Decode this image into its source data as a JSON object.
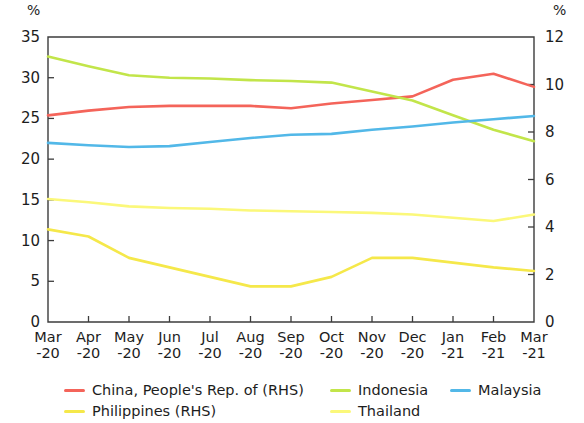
{
  "axes": {
    "left_unit": "%",
    "right_unit": "%",
    "left_ticks": [
      "0",
      "5",
      "10",
      "15",
      "20",
      "25",
      "30",
      "35"
    ],
    "right_ticks": [
      "0",
      "2",
      "4",
      "6",
      "8",
      "10",
      "12"
    ],
    "x_tick_months": [
      "Mar",
      "Apr",
      "May",
      "Jun",
      "Jul",
      "Aug",
      "Sep",
      "Oct",
      "Nov",
      "Dec",
      "Jan",
      "Feb",
      "Mar"
    ],
    "x_tick_years": [
      "-20",
      "-20",
      "-20",
      "-20",
      "-20",
      "-20",
      "-20",
      "-20",
      "-20",
      "-20",
      "-21",
      "-21",
      "-21"
    ]
  },
  "legend": {
    "entries": [
      {
        "label": "China, People's Rep. of (RHS)",
        "color": "#f4645a"
      },
      {
        "label": "Indonesia",
        "color": "#c2e54a"
      },
      {
        "label": "Malaysia",
        "color": "#52b8e8"
      },
      {
        "label": "Philippines (RHS)",
        "color": "#f5e84a"
      },
      {
        "label": "Thailand",
        "color": "#fbf87a"
      }
    ]
  },
  "chart_data": {
    "type": "line",
    "title": "",
    "subtitle": "",
    "xlabel": "",
    "ylabel": "%",
    "y2label": "%",
    "grid": false,
    "legend_position": "bottom",
    "x": [
      "Mar-20",
      "Apr-20",
      "May-20",
      "Jun-20",
      "Jul-20",
      "Aug-20",
      "Sep-20",
      "Oct-20",
      "Nov-20",
      "Dec-20",
      "Jan-21",
      "Feb-21",
      "Mar-21"
    ],
    "ylim": [
      0,
      35
    ],
    "y2lim": [
      0,
      12
    ],
    "series": [
      {
        "name": "China, People's Rep. of (RHS)",
        "color": "#f4645a",
        "axis": "right",
        "values": [
          8.7,
          8.9,
          9.05,
          9.1,
          9.1,
          9.1,
          9.0,
          9.2,
          9.35,
          9.5,
          10.2,
          10.45,
          9.9
        ]
      },
      {
        "name": "Indonesia",
        "color": "#c2e54a",
        "axis": "left",
        "values": [
          32.6,
          31.4,
          30.3,
          30.0,
          29.9,
          29.7,
          29.6,
          29.4,
          28.3,
          27.2,
          25.4,
          23.6,
          22.2
        ]
      },
      {
        "name": "Malaysia",
        "color": "#52b8e8",
        "axis": "left",
        "values": [
          22.0,
          21.7,
          21.5,
          21.6,
          22.1,
          22.6,
          23.0,
          23.1,
          23.6,
          24.0,
          24.5,
          24.9,
          25.3
        ]
      },
      {
        "name": "Philippines (RHS)",
        "color": "#f5e84a",
        "axis": "right",
        "values": [
          3.9,
          3.6,
          2.7,
          2.3,
          1.9,
          1.5,
          1.5,
          1.9,
          2.7,
          2.7,
          2.5,
          2.3,
          2.15
        ]
      },
      {
        "name": "Thailand",
        "color": "#fbf87a",
        "axis": "left",
        "values": [
          15.1,
          14.7,
          14.2,
          14.0,
          13.9,
          13.7,
          13.6,
          13.5,
          13.4,
          13.2,
          12.8,
          12.4,
          13.2
        ]
      }
    ]
  }
}
